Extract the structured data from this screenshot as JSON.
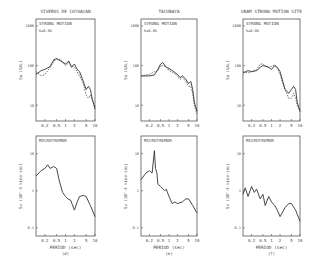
{
  "figure": {
    "columns": [
      {
        "title": "VIVEROS DE COYOACAN",
        "label": "(d)"
      },
      {
        "title": "TACUBAYA",
        "label": "(e)"
      },
      {
        "title": "UNAM STRONG MOTION SITE",
        "label": "(f)"
      }
    ],
    "top_panel_label": "STRONG MOTION",
    "damping_label": "h=0.05",
    "bottom_panel_label": "MICROTREMOR",
    "top_ylabel": "Sa (GAL)",
    "bottom_ylabel": "Sv (10^-4 kine·sec)",
    "xlabel": "PERIOD (sec)",
    "x_ticks": [
      "0.2",
      "0.5",
      "1",
      "2",
      "5",
      "10"
    ],
    "top_y_ticks": [
      "1000",
      "100",
      "10"
    ],
    "bottom_y_ticks": [
      "10",
      "1",
      "0.1"
    ]
  },
  "chart_data": [
    {
      "type": "line",
      "panel": "VIVEROS DE COYOACAN - STRONG MOTION",
      "title": "STRONG MOTION",
      "annotation": "h=0.05",
      "xlabel": "",
      "ylabel": "Sa (GAL)",
      "xscale": "log",
      "yscale": "log",
      "xlim": [
        0.1,
        10
      ],
      "ylim": [
        4,
        1500
      ],
      "x": [
        0.1,
        0.15,
        0.2,
        0.3,
        0.4,
        0.5,
        0.7,
        1.0,
        1.3,
        1.6,
        2.0,
        2.5,
        3.0,
        4.0,
        5.0,
        6.0,
        7.0,
        8.0,
        10.0
      ],
      "series": [
        {
          "name": "observed (solid)",
          "values": [
            60,
            75,
            80,
            95,
            140,
            150,
            130,
            110,
            130,
            90,
            110,
            80,
            70,
            40,
            25,
            30,
            25,
            15,
            8
          ]
        },
        {
          "name": "computed (dashed)",
          "values": [
            70,
            55,
            60,
            90,
            130,
            145,
            140,
            100,
            120,
            100,
            90,
            70,
            55,
            35,
            18,
            15,
            18,
            14,
            9
          ]
        }
      ]
    },
    {
      "type": "line",
      "panel": "TACUBAYA - STRONG MOTION",
      "title": "STRONG MOTION",
      "annotation": "h=0.05",
      "ylabel": "Sa (GAL)",
      "xscale": "log",
      "yscale": "log",
      "xlim": [
        0.1,
        10
      ],
      "ylim": [
        4,
        1500
      ],
      "x": [
        0.1,
        0.2,
        0.3,
        0.4,
        0.5,
        0.6,
        0.8,
        1.0,
        1.5,
        2.0,
        2.5,
        3.0,
        4.0,
        5.0,
        6.0,
        7.0,
        8.0,
        10.0
      ],
      "series": [
        {
          "name": "observed (solid)",
          "values": [
            55,
            55,
            58,
            80,
            110,
            120,
            90,
            85,
            70,
            60,
            50,
            55,
            45,
            35,
            40,
            25,
            12,
            7
          ]
        },
        {
          "name": "computed (dashed)",
          "values": [
            55,
            60,
            70,
            75,
            100,
            100,
            95,
            75,
            65,
            55,
            45,
            50,
            40,
            30,
            30,
            20,
            10,
            6
          ]
        }
      ]
    },
    {
      "type": "line",
      "panel": "UNAM STRONG MOTION SITE - STRONG MOTION",
      "title": "STRONG MOTION",
      "annotation": "h=0.05",
      "ylabel": "Sa (GAL)",
      "xscale": "log",
      "yscale": "log",
      "xlim": [
        0.1,
        10
      ],
      "ylim": [
        4,
        1500
      ],
      "x": [
        0.1,
        0.15,
        0.2,
        0.3,
        0.4,
        0.5,
        0.7,
        1.0,
        1.3,
        1.6,
        2.0,
        2.5,
        3.0,
        4.0,
        5.0,
        6.0,
        7.0,
        8.0,
        10.0
      ],
      "series": [
        {
          "name": "observed (solid)",
          "values": [
            65,
            75,
            70,
            75,
            90,
            100,
            95,
            80,
            100,
            90,
            70,
            40,
            25,
            20,
            25,
            30,
            25,
            12,
            7
          ]
        },
        {
          "name": "computed (dashed)",
          "values": [
            70,
            65,
            70,
            80,
            110,
            110,
            90,
            95,
            105,
            85,
            60,
            35,
            25,
            15,
            15,
            20,
            15,
            10,
            7
          ]
        }
      ]
    },
    {
      "type": "line",
      "panel": "VIVEROS DE COYOACAN - MICROTREMOR",
      "title": "MICROTREMOR",
      "label": "(d)",
      "xlabel": "PERIOD (sec)",
      "ylabel": "Sv (10^-4 kine·sec)",
      "xscale": "log",
      "yscale": "log",
      "xlim": [
        0.1,
        10
      ],
      "ylim": [
        0.06,
        30
      ],
      "x": [
        0.1,
        0.15,
        0.2,
        0.25,
        0.3,
        0.4,
        0.5,
        0.6,
        0.8,
        1.0,
        1.2,
        1.5,
        2.0,
        2.5,
        3.0,
        4.0,
        5.0,
        7.0,
        10.0
      ],
      "series": [
        {
          "name": "microtremor",
          "values": [
            2.5,
            3.5,
            4.0,
            5.0,
            4.0,
            4.5,
            4.0,
            2.0,
            0.9,
            0.7,
            0.6,
            0.55,
            0.3,
            0.5,
            0.7,
            0.75,
            0.7,
            0.4,
            0.2
          ]
        }
      ]
    },
    {
      "type": "line",
      "panel": "TACUBAYA - MICROTREMOR",
      "title": "MICROTREMOR",
      "label": "(e)",
      "xlabel": "PERIOD (sec)",
      "ylabel": "Sv (10^-4 kine·sec)",
      "xscale": "log",
      "yscale": "log",
      "xlim": [
        0.1,
        10
      ],
      "ylim": [
        0.06,
        30
      ],
      "x": [
        0.1,
        0.15,
        0.2,
        0.25,
        0.3,
        0.33,
        0.37,
        0.4,
        0.5,
        0.7,
        0.8,
        1.0,
        1.3,
        1.6,
        2.0,
        3.0,
        4.0,
        5.0,
        7.0,
        10.0
      ],
      "series": [
        {
          "name": "microtremor",
          "values": [
            2.0,
            3.0,
            3.5,
            3.0,
            12.0,
            4.0,
            3.0,
            1.5,
            1.3,
            1.0,
            1.1,
            0.7,
            0.45,
            0.5,
            0.45,
            0.5,
            0.6,
            0.6,
            0.4,
            0.25
          ]
        }
      ]
    },
    {
      "type": "line",
      "panel": "UNAM STRONG MOTION SITE - MICROTREMOR",
      "title": "MICROTREMOR",
      "label": "(f)",
      "xlabel": "PERIOD (sec)",
      "ylabel": "Sv (10^-4 kine·sec)",
      "xscale": "log",
      "yscale": "log",
      "xlim": [
        0.1,
        10
      ],
      "ylim": [
        0.06,
        30
      ],
      "x": [
        0.1,
        0.12,
        0.15,
        0.2,
        0.25,
        0.3,
        0.4,
        0.5,
        0.6,
        0.8,
        1.0,
        1.3,
        1.6,
        2.0,
        3.0,
        4.0,
        5.0,
        7.0,
        10.0
      ],
      "series": [
        {
          "name": "microtremor",
          "values": [
            0.8,
            1.2,
            0.7,
            1.3,
            0.9,
            1.1,
            0.6,
            0.8,
            0.4,
            0.7,
            0.5,
            0.4,
            0.3,
            0.2,
            0.35,
            0.45,
            0.45,
            0.3,
            0.15
          ]
        }
      ]
    }
  ]
}
